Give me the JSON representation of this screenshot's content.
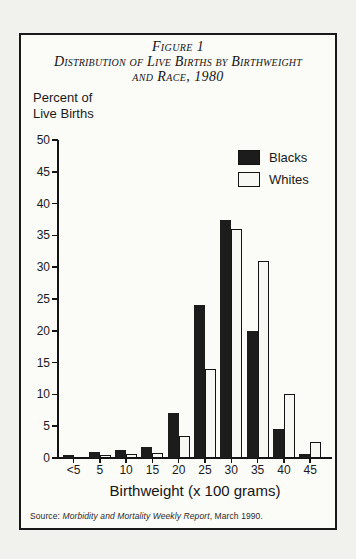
{
  "figure": {
    "title_line1": "Figure 1",
    "title_line2": "Distribution of Live Births by Birthweight",
    "title_line3": "and Race, 1980",
    "y_axis_label_line1": "Percent of",
    "y_axis_label_line2": "Live Births",
    "x_axis_title": "Birthweight (x 100 grams)",
    "source_prefix": "Source: ",
    "source_italic": "Morbidity and Mortality Weekly Report",
    "source_suffix": ", March 1990."
  },
  "colors": {
    "black_bar": "#1c1c1c",
    "white_bar": "#f7f7f3",
    "axis": "#141414",
    "frame_border": "#191919",
    "page_background": "#f1f1ee",
    "panel_background": "#fbfbf8"
  },
  "chart_data": {
    "type": "bar",
    "xlabel": "Birthweight (x 100 grams)",
    "ylabel": "Percent of Live Births",
    "categories": [
      "<5",
      "5",
      "10",
      "15",
      "20",
      "25",
      "30",
      "35",
      "40",
      "45"
    ],
    "series": [
      {
        "name": "Blacks",
        "color": "#1c1c1c",
        "values": [
          0.5,
          0.9,
          1.2,
          1.8,
          7,
          24,
          37.5,
          20,
          4.5,
          0.7
        ]
      },
      {
        "name": "Whites",
        "color": "#f7f7f3",
        "values": [
          0.2,
          0.4,
          0.7,
          0.8,
          3.5,
          14,
          36,
          31,
          10,
          2.5
        ]
      }
    ],
    "ylim": [
      0,
      50
    ],
    "yticks": [
      0,
      5,
      10,
      15,
      20,
      25,
      30,
      35,
      40,
      45,
      50
    ],
    "legend_position": "top-right",
    "grid": false,
    "source": "Source: Morbidity and Mortality Weekly Report, March 1990."
  }
}
